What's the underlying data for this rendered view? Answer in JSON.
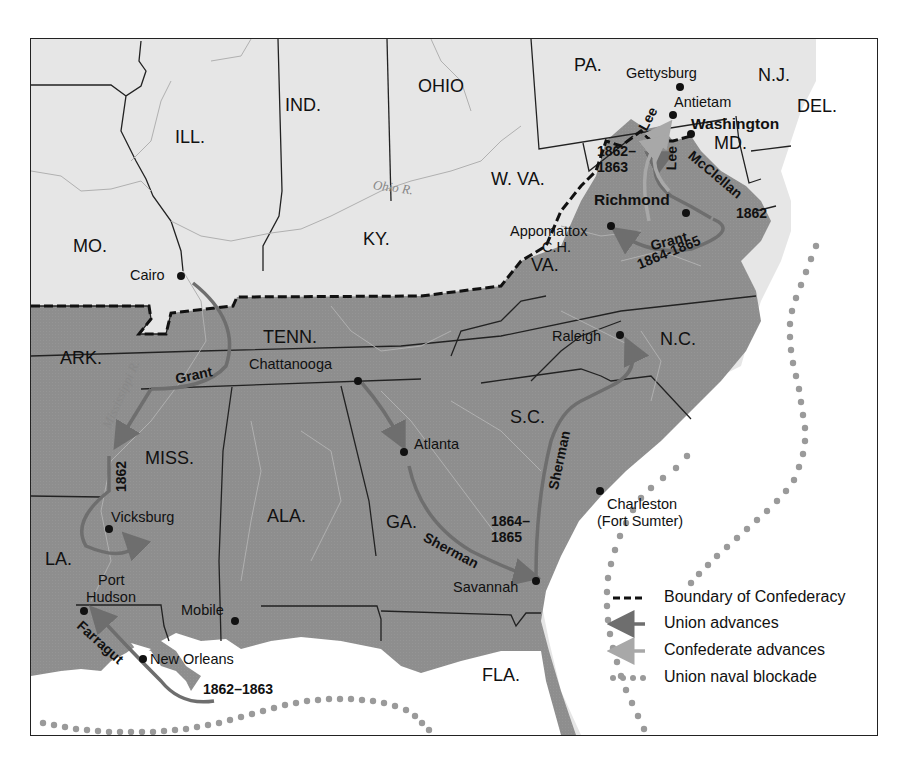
{
  "map": {
    "title": "",
    "states": {
      "union": [
        "ILL.",
        "IND.",
        "OHIO",
        "PA.",
        "N.J.",
        "DEL.",
        "MD.",
        "W. VA.",
        "KY.",
        "MO."
      ],
      "confederate": [
        "VA.",
        "N.C.",
        "TENN.",
        "ARK.",
        "MISS.",
        "ALA.",
        "GA.",
        "S.C.",
        "LA.",
        "FLA."
      ]
    },
    "labels": {
      "mo": "MO.",
      "ill": "ILL.",
      "ind": "IND.",
      "ohio": "OHIO",
      "pa": "PA.",
      "nj": "N.J.",
      "del": "DEL.",
      "md": "MD.",
      "wva": "W. VA.",
      "ky": "KY.",
      "va": "VA.",
      "nc": "N.C.",
      "tenn": "TENN.",
      "ark": "ARK.",
      "miss": "MISS.",
      "ala": "ALA.",
      "ga": "GA.",
      "sc": "S.C.",
      "la": "LA.",
      "fla": "FLA."
    },
    "rivers": {
      "ohio": "Ohio R.",
      "mississippi": "Mississippi R."
    },
    "cities": {
      "cairo": "Cairo",
      "gettysburg": "Gettysburg",
      "antietam": "Antietam",
      "washington": "Washington",
      "richmond": "Richmond",
      "appomattox_1": "Appomattox",
      "appomattox_2": "C.H.",
      "chattanooga": "Chattanooga",
      "atlanta": "Atlanta",
      "raleigh": "Raleigh",
      "charleston_1": "Charleston",
      "charleston_2": "(Fort Sumter)",
      "savannah": "Savannah",
      "vicksburg": "Vicksburg",
      "port_hudson_1": "Port",
      "port_hudson_2": "Hudson",
      "mobile": "Mobile",
      "new_orleans": "New Orleans"
    },
    "campaigns": {
      "lee_1": "Lee",
      "lee_2": "Lee",
      "lee_years_1": "1862–",
      "lee_years_2": "1863",
      "mcclellan": "McClellan",
      "mcclellan_year": "1862",
      "grant_east": "Grant",
      "grant_east_years": "1864-1865",
      "grant_west": "Grant",
      "grant_west_year": "1862",
      "sherman_ga": "Sherman",
      "sherman_sc": "Sherman",
      "sherman_years_1": "1864–",
      "sherman_years_2": "1865",
      "farragut": "Farragut",
      "farragut_years": "1862–1863"
    }
  },
  "legend": {
    "items": [
      {
        "symbol": "dashed-line",
        "label": "Boundary of Confederacy"
      },
      {
        "symbol": "union-arrow",
        "label": "Union advances"
      },
      {
        "symbol": "confederate-arrow",
        "label": "Confederate advances"
      },
      {
        "symbol": "dotted-line",
        "label": "Union naval blockade"
      }
    ]
  },
  "colors": {
    "union_land": "#e6e6e6",
    "confederate_land": "#8c8c8c",
    "water": "#ffffff",
    "union_arrow": "#6e6e6e",
    "confederate_arrow": "#a8a8a8",
    "blockade_dots": "#9a9a9a",
    "border": "#222222"
  }
}
